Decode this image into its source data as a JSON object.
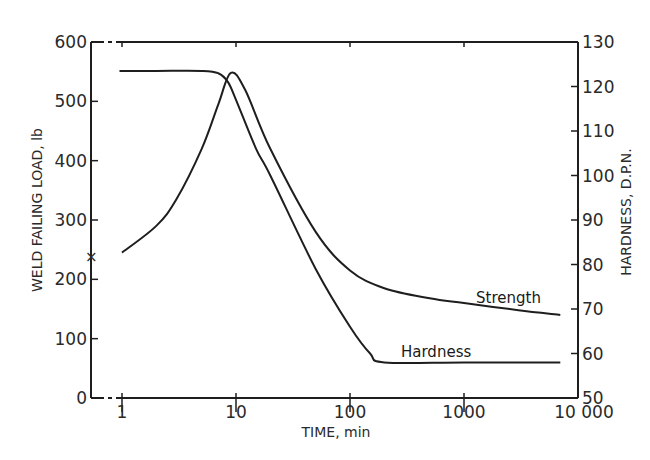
{
  "chart_data": {
    "type": "line",
    "title": "",
    "xlabel": "TIME, min",
    "ylabel_left": "WELD FAILING LOAD, lb",
    "ylabel_right": "HARDNESS, D.P.N.",
    "xscale": "log",
    "xlim": [
      0.75,
      10000
    ],
    "ylim_left": [
      0,
      600
    ],
    "ylim_right": [
      50,
      130
    ],
    "grid": false,
    "legend": "inline labels",
    "x_ticks": [
      1,
      10,
      100,
      1000,
      10000
    ],
    "x_tick_labels": [
      "1",
      "10",
      "100",
      "1000",
      "10 000"
    ],
    "y_left_ticks": [
      0,
      100,
      200,
      300,
      400,
      500,
      600
    ],
    "y_right_ticks": [
      50,
      60,
      70,
      80,
      90,
      100,
      110,
      120,
      130
    ],
    "annotations": [
      {
        "text": "x",
        "note": "marker on left axis at ~240 lb"
      }
    ],
    "series": [
      {
        "name": "Strength",
        "axis": "left",
        "unit": "lb",
        "x": [
          1,
          2,
          3,
          5,
          7,
          9,
          12,
          20,
          50,
          100,
          200,
          500,
          1000,
          3000,
          7000
        ],
        "values": [
          245,
          290,
          335,
          420,
          495,
          548,
          520,
          420,
          280,
          215,
          185,
          168,
          160,
          148,
          140
        ]
      },
      {
        "name": "Hardness",
        "axis": "right",
        "unit": "D.P.N.",
        "x": [
          0.95,
          2,
          5,
          7,
          8.5,
          10,
          15,
          20,
          50,
          100,
          150,
          200,
          1000,
          7000
        ],
        "values": [
          123.5,
          123.5,
          123.5,
          123,
          121,
          117,
          106,
          100,
          79,
          66,
          60,
          58,
          58,
          58
        ]
      }
    ]
  },
  "labels": {
    "strength": "Strength",
    "hardness": "Hardness",
    "xlabel": "TIME, min",
    "ylabel_left": "WELD FAILING LOAD, lb",
    "ylabel_right": "HARDNESS, D.P.N.",
    "cross_marker": "×",
    "x_ticks": [
      "1",
      "10",
      "100",
      "1000",
      "10 000"
    ],
    "y_left_ticks": [
      "0",
      "100",
      "200",
      "300",
      "400",
      "500",
      "600"
    ],
    "y_right_ticks": [
      "50",
      "60",
      "70",
      "80",
      "90",
      "100",
      "110",
      "120",
      "130"
    ]
  },
  "colors": {
    "line": "#1e1e1e",
    "text": "#2a2a2a",
    "background": "#ffffff"
  }
}
